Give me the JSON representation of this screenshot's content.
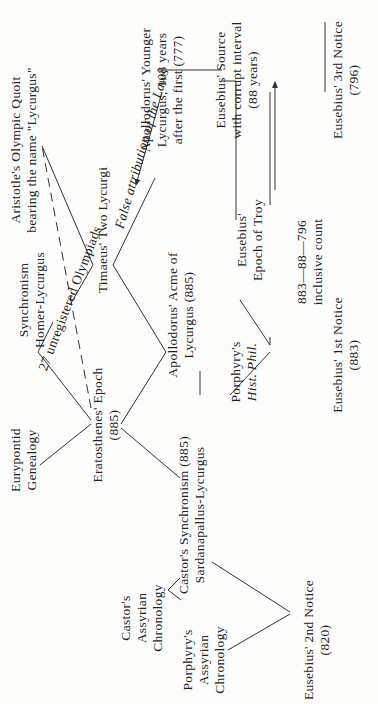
{
  "diagram": {
    "orientation": "rotated-90-ccw",
    "nodes": {
      "aristotle": {
        "line1": "Aristotle's Olympic Quoit",
        "line2": "bearing the name \"Lycurgus\""
      },
      "apollodorus_younger": {
        "line1": "Apollodorus' Younger",
        "line2": "Lycurgus, 108 years",
        "line3": "after the first (777)"
      },
      "eusebius_source": {
        "line1": "Eusebius' Source",
        "line2": "with corrupt interval",
        "line3": "(88 years)"
      },
      "eusebius_3rd": {
        "line1": "Eusebius' 3rd Notice",
        "line2": "(796)"
      },
      "synchronism_homer": {
        "line1": "Synchronism",
        "line2": "Homer-Lycurgus"
      },
      "unregistered": {
        "text": "27 unregistered Olympiads"
      },
      "timaeus": {
        "text": "Timaeus' Two Lycurgi"
      },
      "false_attribution": {
        "text": "False attribution of the Laws"
      },
      "eusebius_troy": {
        "line1": "Eusebius'",
        "line2": "Epoch of Troy"
      },
      "inclusive_count": {
        "line1": "883—88—796",
        "line2": "inclusive count"
      },
      "eurypontid": {
        "line1": "Eurypontid",
        "line2": "Genealogy"
      },
      "eratosthenes": {
        "line1": "Eratosthenes' Epoch",
        "line2": "(885)"
      },
      "apollodorus_acme": {
        "line1": "Apollodorus' Acme of",
        "line2": "Lycurgus (885)"
      },
      "porphyry_hist": {
        "line1": "Porphyry's",
        "line2": "Hist. Phil."
      },
      "eusebius_1st": {
        "line1": "Eusebius' 1st Notice",
        "line2": "(883)"
      },
      "castor_assyrian": {
        "line1": "Castor's",
        "line2": "Assyrian",
        "line3": "Chronology"
      },
      "castor_synchronism": {
        "line1": "Castor's Synchronism (885)",
        "line2": "Sardanapallus-Lycurgus"
      },
      "porphyry_assyrian": {
        "line1": "Porphyry's",
        "line2": "Assyrian",
        "line3": "Chronology"
      },
      "eusebius_2nd": {
        "line1": "Eusebius' 2nd Notice",
        "line2": "(820)"
      }
    },
    "colors": {
      "ink": "#222222",
      "paper": "#fdfdfc"
    }
  }
}
